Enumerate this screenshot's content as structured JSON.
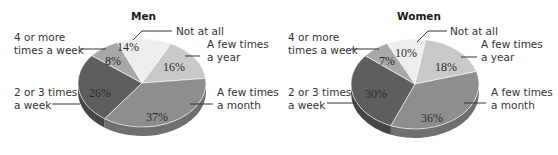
{
  "chart_data": [
    {
      "type": "pie",
      "title": "Men",
      "categories": [
        "Not at all",
        "A few times a year",
        "A few times a month",
        "2 or 3 times a week",
        "4 or more times a week"
      ],
      "values": [
        14,
        16,
        37,
        26,
        8
      ],
      "value_labels": [
        "14%",
        "16%",
        "37%",
        "26%",
        "8%"
      ],
      "style": "3d"
    },
    {
      "type": "pie",
      "title": "Women",
      "categories": [
        "Not at all",
        "A few times a year",
        "A few times a month",
        "2 or 3 times a week",
        "4 or more times a week"
      ],
      "values": [
        10,
        18,
        36,
        30,
        7
      ],
      "value_labels": [
        "10%",
        "18%",
        "36%",
        "30%",
        "7%"
      ],
      "style": "3d"
    }
  ],
  "men": {
    "title": "Men",
    "labels": {
      "not_at_all": "Not at all",
      "few_year": "A few times\na year",
      "few_month": "A few times\na month",
      "two_three_week": "2 or 3 times\na week",
      "four_more_week": "4 or more\ntimes a week"
    },
    "pcts": {
      "not_at_all": "14%",
      "few_year": "16%",
      "few_month": "37%",
      "two_three_week": "26%",
      "four_more_week": "8%"
    }
  },
  "women": {
    "title": "Women",
    "labels": {
      "not_at_all": "Not at all",
      "few_year": "A few times\na year",
      "few_month": "A few times\na month",
      "two_three_week": "2 or 3 times\na week",
      "four_more_week": "4 or more\ntimes a week"
    },
    "pcts": {
      "not_at_all": "10%",
      "few_year": "18%",
      "few_month": "36%",
      "two_three_week": "30%",
      "four_more_week": "7%"
    }
  },
  "colors": {
    "not_at_all": "#ececec",
    "few_year": "#c4c4c4",
    "few_month": "#8f8f8f",
    "two_three_week": "#5f5f5f",
    "four_more_week": "#a9a9a9",
    "leader": "#333333"
  }
}
